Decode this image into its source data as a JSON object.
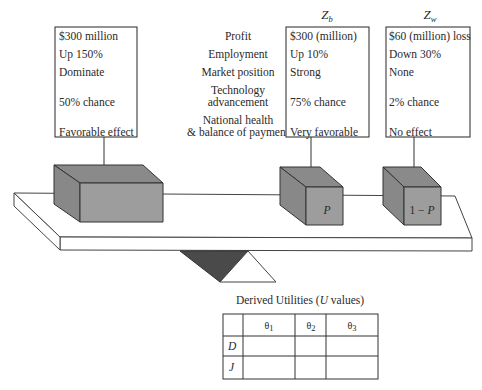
{
  "headers": {
    "zb": {
      "main": "Z",
      "sub": "b"
    },
    "zw": {
      "main": "Z",
      "sub": "w"
    }
  },
  "attributes": {
    "profit": "Profit",
    "employment": "Employment",
    "market_position": "Market position",
    "technology_line1": "Technology",
    "technology_line2": "advancement",
    "national_line1": "National health",
    "national_line2": "& balance of payment"
  },
  "left_box": {
    "profit": "$300 million",
    "employment": "Up 150%",
    "market_position": "Dominate",
    "technology": "50% chance",
    "national": "Favorable effect"
  },
  "zb_box": {
    "profit": "$300 (million)",
    "employment": "Up 10%",
    "market_position": "Strong",
    "technology": "75% chance",
    "national": "Very favorable"
  },
  "zw_box": {
    "profit": "$60 (million) loss",
    "employment": "Down 30%",
    "market_position": "None",
    "technology": "2% chance",
    "national": "No effect"
  },
  "blocks": {
    "left": "",
    "middle": "P",
    "right": "1 − P"
  },
  "table": {
    "title_prefix": "Derived Utilities (",
    "title_var": "U",
    "title_suffix": " values)",
    "columns": [
      {
        "main": "θ",
        "sub": "1"
      },
      {
        "main": "θ",
        "sub": "2"
      },
      {
        "main": "θ",
        "sub": "3"
      }
    ],
    "rows": [
      {
        "label": "D",
        "values": [
          "",
          "",
          ""
        ]
      },
      {
        "label": "J",
        "values": [
          "",
          "",
          ""
        ]
      }
    ]
  }
}
